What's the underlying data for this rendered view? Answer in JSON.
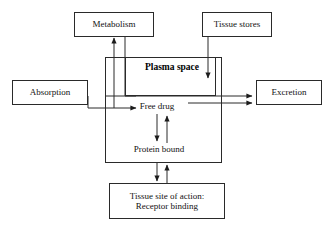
{
  "diagram": {
    "type": "flow-diagram",
    "stroke_color": "#2a2a2a",
    "text_color": "#111111",
    "background": "#ffffff",
    "nodes": {
      "metabolism": {
        "label": "Metabolism"
      },
      "tissue_stores": {
        "label": "Tissue stores"
      },
      "absorption": {
        "label": "Absorption"
      },
      "excretion": {
        "label": "Excretion"
      },
      "plasma_space": {
        "label": "Plasma space"
      },
      "free_drug": {
        "label": "Free drug"
      },
      "protein_bound": {
        "label": "Protein bound"
      },
      "tissue_site": {
        "label": "Tissue site of action:\nReceptor binding"
      }
    },
    "edges": [
      {
        "from": "absorption",
        "to": "free_drug",
        "direction": "right"
      },
      {
        "from": "free_drug",
        "to": "metabolism",
        "direction": "up"
      },
      {
        "from": "metabolism",
        "to": "free_drug",
        "direction": "down-right"
      },
      {
        "from": "tissue_stores",
        "to": "plasma_space",
        "direction": "down"
      },
      {
        "from": "plasma_space",
        "to": "excretion",
        "direction": "right"
      },
      {
        "from": "free_drug",
        "to": "excretion",
        "direction": "right"
      },
      {
        "from": "free_drug",
        "to": "protein_bound",
        "direction": "down"
      },
      {
        "from": "protein_bound",
        "to": "free_drug",
        "direction": "up"
      },
      {
        "from": "plasma_space",
        "to": "tissue_site",
        "direction": "down"
      },
      {
        "from": "tissue_site",
        "to": "plasma_space",
        "direction": "up"
      }
    ]
  }
}
